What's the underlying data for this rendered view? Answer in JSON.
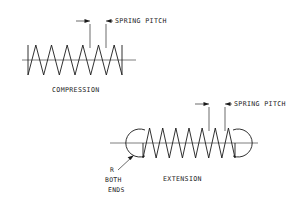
{
  "diagram": {
    "title_visible": false,
    "background_color": "#ffffff",
    "line_color": "#1a1a1a",
    "centerline_color": "#5e5e5e"
  },
  "compression": {
    "label": "COMPRESSION",
    "pitch_label": "SPRING PITCH",
    "coil_cycles": 6,
    "geometry": {
      "x_start": 28,
      "x_end": 122,
      "center_y": 60,
      "amplitude": 15,
      "centerline_x_start": 22,
      "centerline_x_end": 136
    },
    "pitch_dimension": {
      "ext_line_1_x": 90,
      "ext_line_2_x": 106,
      "ext_line_top_y": 24,
      "ext_line_bottom_y": 48,
      "arrow_y": 21,
      "left_arrow_from_x": 74,
      "right_arrow_to_x": 122
    }
  },
  "extension": {
    "label": "EXTENSION",
    "pitch_label": "SPRING PITCH",
    "hook_note_lines": [
      "R",
      "BOTH",
      "ENDS"
    ],
    "coil_cycles": 7,
    "geometry": {
      "x_start": 143,
      "x_end": 235,
      "center_y": 143,
      "amplitude": 15,
      "centerline_x_start": 110,
      "centerline_x_end": 258
    },
    "hooks": {
      "left_center_x": 140,
      "right_center_x": 238,
      "radius": 14
    },
    "pitch_dimension": {
      "ext_line_1_x": 209,
      "ext_line_2_x": 225,
      "ext_line_top_y": 107,
      "ext_line_bottom_y": 131,
      "arrow_y": 104,
      "left_arrow_from_x": 193,
      "right_arrow_to_x": 241
    },
    "leader": {
      "from_x": 124,
      "from_y": 170,
      "to_x": 137,
      "to_y": 155
    }
  },
  "labels": {
    "compression_pos": {
      "x": 52,
      "y": 92
    },
    "extension_pos": {
      "x": 163,
      "y": 181
    },
    "pitch_top_pos": {
      "x": 115,
      "y": 23
    },
    "pitch_bottom_pos": {
      "x": 234,
      "y": 106
    },
    "note_r_pos": {
      "x": 110,
      "y": 172
    },
    "note_both_pos": {
      "x": 107,
      "y": 182
    },
    "note_ends_pos": {
      "x": 110,
      "y": 192
    }
  }
}
